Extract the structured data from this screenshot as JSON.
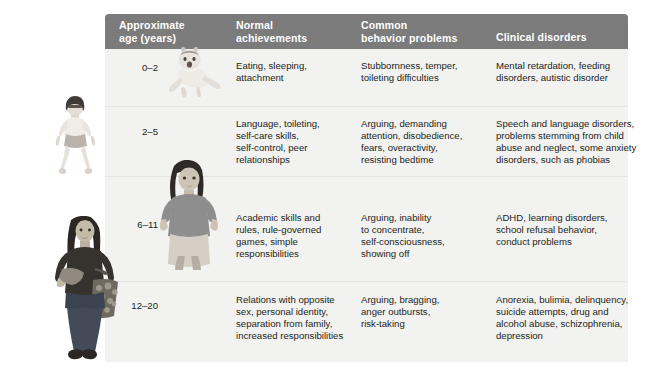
{
  "figure": {
    "credit": "Based on Achenbach, 1982; Tully & Goodman, 2007",
    "header_bg": "#7b7b7b",
    "panel_bg": "#f2f2f0",
    "text_color": "#231f20"
  },
  "table": {
    "columns": [
      {
        "key": "age",
        "label": "Approximate\nage (years)"
      },
      {
        "key": "normal",
        "label": "Normal\nachievements"
      },
      {
        "key": "behavior",
        "label": "Common\nbehavior problems"
      },
      {
        "key": "clinical",
        "label": "Clinical disorders"
      }
    ],
    "rows": [
      {
        "age": "0–2",
        "normal": "Eating, sleeping,\nattachment",
        "behavior": "Stubbornness, temper,\ntoileting difficulties",
        "clinical": "Mental retardation, feeding\ndisorders, autistic disorder",
        "photo_name": "infant-photo"
      },
      {
        "age": "2–5",
        "normal": "Language, toileting,\nself-care skills,\nself-control, peer\nrelationships",
        "behavior": "Arguing, demanding\nattention, disobedience,\nfears, overactivity,\nresisting bedtime",
        "clinical": "Speech and language disorders,\nproblems stemming from child\nabuse and neglect, some anxiety\ndisorders, such as phobias",
        "photo_name": "preschooler-photo"
      },
      {
        "age": "6–11",
        "normal": "Academic skills and\nrules, rule-governed\ngames, simple\nresponsibilities",
        "behavior": "Arguing, inability\nto concentrate,\nself-consciousness,\nshowing off",
        "clinical": "ADHD, learning disorders,\nschool refusal behavior,\nconduct problems",
        "photo_name": "schoolchild-photo"
      },
      {
        "age": "12–20",
        "normal": "Relations with opposite\nsex, personal identity,\nseparation from family,\nincreased responsibilities",
        "behavior": "Arguing, bragging,\nanger outbursts,\nrisk-taking",
        "clinical": "Anorexia, bulimia, delinquency,\nsuicide attempts, drug and\nalcohol abuse, schizophrenia,\ndepression",
        "photo_name": "teenager-photo"
      }
    ]
  }
}
